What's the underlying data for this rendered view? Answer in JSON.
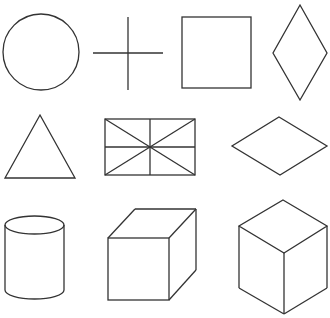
{
  "diagram": {
    "background": "#ffffff",
    "stroke_color": "#333333",
    "rows": [
      {
        "shapes": [
          {
            "name": "circle",
            "cx": 41,
            "cy": 52,
            "r": 38
          },
          {
            "name": "cross",
            "h": [
              93,
              53,
              163,
              53
            ],
            "v": [
              128,
              17,
              128,
              90
            ]
          },
          {
            "name": "square",
            "x": 182,
            "y": 17,
            "w": 69,
            "h": 71
          },
          {
            "name": "vertical-rhombus",
            "points": "300,5 327,53 300,100 273,53"
          }
        ]
      },
      {
        "shapes": [
          {
            "name": "triangle",
            "points": "40,115 75,178 5,178"
          },
          {
            "name": "rectangle-with-diagonals",
            "x": 105,
            "y": 119,
            "w": 90,
            "h": 56
          },
          {
            "name": "horizontal-rhombus",
            "points": "279,117 327,146 280,175 232,146"
          }
        ]
      },
      {
        "shapes": [
          {
            "name": "cylinder"
          },
          {
            "name": "oblique-cube"
          },
          {
            "name": "isometric-cube"
          }
        ]
      }
    ]
  }
}
